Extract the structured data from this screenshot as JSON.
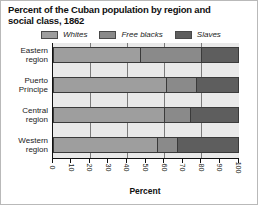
{
  "title": "Percent of the Cuban population by region and social class, 1862",
  "xlabel": "Percent",
  "colors": {
    "whites": "#9e9e9e",
    "free_blacks": "#8a8a8a",
    "slaves": "#5e5e5e",
    "plot_background": "#e9e9e9",
    "gridline": "#7c7c7c",
    "axis": "#111111"
  },
  "legend": {
    "items": [
      {
        "label": "Whites",
        "color": "#9e9e9e"
      },
      {
        "label": "Free blacks",
        "color": "#8a8a8a"
      },
      {
        "label": "Slaves",
        "color": "#5e5e5e"
      }
    ]
  },
  "chart_data": {
    "type": "bar",
    "stacked": true,
    "orientation": "horizontal",
    "title": "Percent of the Cuban population by region and social class, 1862",
    "xlabel": "Percent",
    "categories": [
      "Eastern region",
      "Puerto Príncipe",
      "Central region",
      "Western region"
    ],
    "category_label_lines": [
      [
        "Eastern",
        "region"
      ],
      [
        "Puerto",
        "Príncipe"
      ],
      [
        "Central",
        "region"
      ],
      [
        "Western",
        "region"
      ]
    ],
    "series": [
      {
        "name": "Whites",
        "color": "#9e9e9e",
        "values": [
          47,
          61,
          60,
          56
        ]
      },
      {
        "name": "Free blacks",
        "color": "#8a8a8a",
        "values": [
          33,
          16,
          14,
          11
        ]
      },
      {
        "name": "Slaves",
        "color": "#5e5e5e",
        "values": [
          20,
          23,
          26,
          33
        ]
      }
    ],
    "xlim": [
      0,
      100
    ],
    "xticks": [
      0,
      10,
      20,
      30,
      40,
      50,
      60,
      70,
      80,
      90,
      100
    ],
    "gridlines_at": [
      20,
      40,
      60,
      80
    ],
    "grid": true,
    "legend_position": "top"
  }
}
